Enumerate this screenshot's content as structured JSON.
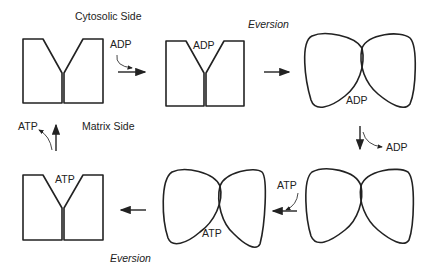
{
  "labels": {
    "cytosolic_side": "Cytosolic Side",
    "matrix_side": "Matrix Side",
    "eversion_top": "Eversion",
    "eversion_bottom": "Eversion",
    "adp_in": "ADP",
    "adp_bound_c": "ADP",
    "adp_bound_m": "ADP",
    "adp_out": "ADP",
    "atp_in": "ATP",
    "atp_bound_m": "ATP",
    "atp_bound_c": "ATP",
    "atp_out": "ATP"
  },
  "states": [
    {
      "id": "c-empty",
      "form": "c-state",
      "ligand": ""
    },
    {
      "id": "c-adp",
      "form": "c-state",
      "ligand": "ADP"
    },
    {
      "id": "m-adp",
      "form": "m-state",
      "ligand": "ADP"
    },
    {
      "id": "m-empty",
      "form": "m-state",
      "ligand": ""
    },
    {
      "id": "m-atp",
      "form": "m-state",
      "ligand": "ATP"
    },
    {
      "id": "c-atp",
      "form": "c-state",
      "ligand": "ATP"
    }
  ],
  "colors": {
    "stroke": "#222222",
    "background": "#ffffff"
  }
}
